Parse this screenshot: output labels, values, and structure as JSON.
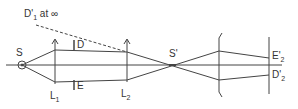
{
  "diagram": {
    "type": "optical-system-ray-diagram",
    "stroke_color": "#444444",
    "labels": {
      "source": "S",
      "lens1_main": "L",
      "lens1_sub": "1",
      "lens2_main": "L",
      "lens2_sub": "2",
      "stop_D": "D",
      "stop_E": "E",
      "image_source": "S'",
      "d1_main": "D'",
      "d1_sub": "1",
      "d1_suffix": " at ∞",
      "e2_main": "E'",
      "e2_sub": "2",
      "d2_main": "D'",
      "d2_sub": "2"
    },
    "elements": [
      {
        "id": "source",
        "label": "S",
        "shape": "circle-point",
        "x": 22,
        "y": 65
      },
      {
        "id": "lens1",
        "label": "L1",
        "shape": "converging-lens-arrow",
        "x": 55
      },
      {
        "id": "stop-D",
        "label": "D",
        "shape": "aperture-top",
        "x": 74
      },
      {
        "id": "stop-E",
        "label": "E",
        "shape": "aperture-bottom",
        "x": 74
      },
      {
        "id": "lens2",
        "label": "L2",
        "shape": "converging-lens-arrow",
        "x": 127
      },
      {
        "id": "image-point",
        "label": "S'",
        "shape": "crossover",
        "x": 172
      },
      {
        "id": "lens3",
        "label": "",
        "shape": "diverging-lens",
        "x": 219
      },
      {
        "id": "screen",
        "label": "",
        "shape": "plane",
        "x": 269
      }
    ],
    "annotations": [
      {
        "text": "D'1 at ∞",
        "style": "dashed-line"
      },
      {
        "text": "E'2"
      },
      {
        "text": "D'2"
      }
    ]
  }
}
